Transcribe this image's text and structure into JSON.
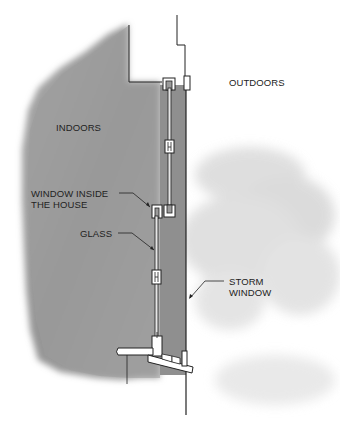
{
  "diagram": {
    "labels": {
      "indoors": "INDOORS",
      "outdoors": "OUTDOORS",
      "window_inside_line1": "WINDOW INSIDE",
      "window_inside_line2": "THE HOUSE",
      "glass": "GLASS",
      "storm_line1": "STORM",
      "storm_line2": "WINDOW"
    },
    "colors": {
      "indoor_fill": "#9a9a9a",
      "air_gap_fill": "#8c8c8c",
      "outline": "#222222",
      "frame_fill": "#ffffff",
      "tree_fill": "#d8d8d8",
      "background": "#ffffff"
    }
  }
}
